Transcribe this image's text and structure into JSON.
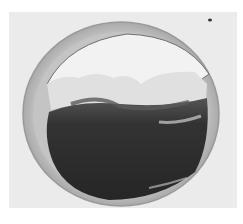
{
  "image": {
    "description": "Grayscale micrograph of a circular vessel cross-section with dark thrombus filling the lower lumen and a pale layer above",
    "colors": {
      "page_background": "#ffffff",
      "photo_background": "#ebebeb",
      "vessel_wall": "#b8b8b8",
      "wall_dark_edge": "#7a7a7a",
      "lumen": "#f2f2f2",
      "pale_layer": "#e0e0e0",
      "thrombus": "#2e2e2e",
      "thrombus_mid": "#4a4a4a"
    }
  }
}
